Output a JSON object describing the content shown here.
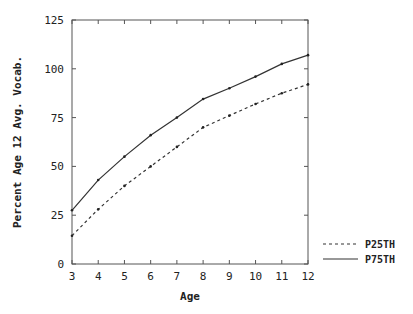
{
  "chart_data": {
    "type": "line",
    "title": "",
    "xlabel": "Age",
    "ylabel": "Percent Age 12 Avg. Vocab.",
    "x": [
      3,
      4,
      5,
      6,
      7,
      8,
      9,
      10,
      11,
      12
    ],
    "xticks": [
      "3",
      "4",
      "5",
      "6",
      "7",
      "8",
      "9",
      "10",
      "11",
      "12"
    ],
    "yticks": [
      "0",
      "25",
      "50",
      "75",
      "100",
      "125"
    ],
    "xlim": [
      3,
      12
    ],
    "ylim": [
      0,
      125
    ],
    "grid": false,
    "legend_position": "right-bottom",
    "series": [
      {
        "name": "P25TH",
        "style": "dashed",
        "color": "#333333",
        "values": [
          14.5,
          28,
          40,
          50,
          60,
          70,
          76,
          82,
          87.5,
          92
        ]
      },
      {
        "name": "P75TH",
        "style": "solid",
        "color": "#333333",
        "values": [
          27.5,
          43,
          55,
          66,
          75,
          84.5,
          90,
          96,
          102.5,
          107
        ]
      }
    ]
  }
}
